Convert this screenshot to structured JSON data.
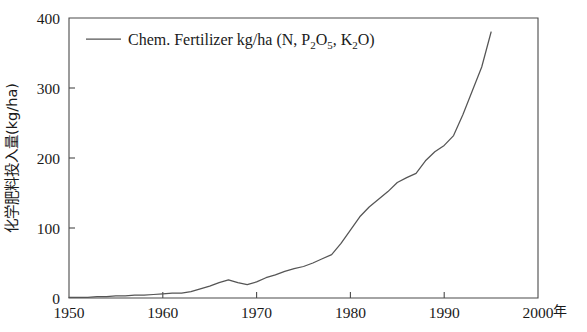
{
  "chart_data": {
    "type": "line",
    "title": "",
    "subtitle": "",
    "xlabel": "",
    "ylabel": "化学肥料投入量(kg/ha)",
    "x_unit_label": "年",
    "xlim": [
      1950,
      2000
    ],
    "ylim": [
      0,
      400
    ],
    "grid": false,
    "legend_position": "top-left-inside",
    "x_ticks": [
      1950,
      1960,
      1970,
      1980,
      1990,
      2000
    ],
    "x_tick_labels": [
      "1950",
      "1960",
      "1970",
      "1980",
      "1990",
      "2000"
    ],
    "y_ticks": [
      0,
      100,
      200,
      300,
      400
    ],
    "y_tick_labels": [
      "0",
      "100",
      "200",
      "300",
      "400"
    ],
    "series": [
      {
        "name": "Chem. Fertilizer kg/ha (N, P2O5, K2O)",
        "name_parts": [
          {
            "text": "Chem. Fertilizer kg/ha (N, P",
            "sub": false
          },
          {
            "text": "2",
            "sub": true
          },
          {
            "text": "O",
            "sub": false
          },
          {
            "text": "5",
            "sub": true
          },
          {
            "text": ", K",
            "sub": false
          },
          {
            "text": "2",
            "sub": true
          },
          {
            "text": "O)",
            "sub": false
          }
        ],
        "color": "#555555",
        "x": [
          1950,
          1951,
          1952,
          1953,
          1954,
          1955,
          1956,
          1957,
          1958,
          1959,
          1960,
          1961,
          1962,
          1963,
          1964,
          1965,
          1966,
          1967,
          1968,
          1969,
          1970,
          1971,
          1972,
          1973,
          1974,
          1975,
          1976,
          1977,
          1978,
          1979,
          1980,
          1981,
          1982,
          1983,
          1984,
          1985,
          1986,
          1987,
          1988,
          1989,
          1990,
          1991,
          1992,
          1993,
          1994,
          1995
        ],
        "values": [
          1,
          1,
          1,
          2,
          2,
          3,
          3,
          4,
          4,
          5,
          6,
          7,
          7,
          9,
          13,
          17,
          22,
          26,
          22,
          19,
          23,
          29,
          33,
          38,
          42,
          45,
          50,
          56,
          62,
          78,
          97,
          116,
          130,
          141,
          152,
          165,
          172,
          178,
          196,
          209,
          218,
          232,
          262,
          296,
          330,
          380
        ]
      }
    ]
  },
  "legend": {
    "entry_label": "Chem. Fertilizer kg/ha (N, P2O5, K2O)"
  }
}
